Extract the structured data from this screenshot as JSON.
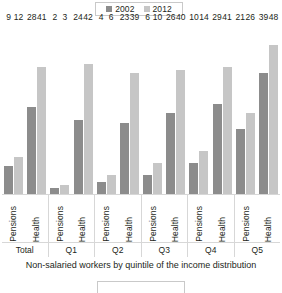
{
  "legend": {
    "position": "top-center",
    "entries": [
      {
        "label": "2002",
        "color": "#8c8c8c"
      },
      {
        "label": "2012",
        "color": "#c6c6c6"
      }
    ]
  },
  "caption": "Non-salaried workers by quintile of the income distribution",
  "chart_data": {
    "type": "bar",
    "title": "",
    "subtitle": "",
    "xlabel": "Non-salaried workers by quintile of the income distribution",
    "ylabel": "",
    "ylim": [
      0,
      52
    ],
    "grid": false,
    "legend_position": "top-center",
    "groups": [
      "Total",
      "Q1",
      "Q2",
      "Q3",
      "Q4",
      "Q5"
    ],
    "subcategories": [
      "Pensions",
      "Health"
    ],
    "categories": [
      "Total - Pensions",
      "Total - Health",
      "Q1 - Pensions",
      "Q1 - Health",
      "Q2 - Pensions",
      "Q2 - Health",
      "Q3 - Pensions",
      "Q3 - Health",
      "Q4 - Pensions",
      "Q4 - Health",
      "Q5 - Pensions",
      "Q5 - Health"
    ],
    "series": [
      {
        "name": "2002",
        "color": "#8c8c8c",
        "values": [
          9,
          28,
          2,
          24,
          4,
          23,
          6,
          26,
          10,
          29,
          21,
          39
        ]
      },
      {
        "name": "2012",
        "color": "#c6c6c6",
        "values": [
          12,
          41,
          3,
          42,
          6,
          39,
          10,
          40,
          14,
          41,
          26,
          48
        ]
      }
    ],
    "grouped": [
      {
        "group": "Total",
        "pairs": [
          {
            "label": "Pensions",
            "v2002": 9,
            "v2012": 12
          },
          {
            "label": "Health",
            "v2002": 28,
            "v2012": 41
          }
        ]
      },
      {
        "group": "Q1",
        "pairs": [
          {
            "label": "Pensions",
            "v2002": 2,
            "v2012": 3
          },
          {
            "label": "Health",
            "v2002": 24,
            "v2012": 42
          }
        ]
      },
      {
        "group": "Q2",
        "pairs": [
          {
            "label": "Pensions",
            "v2002": 4,
            "v2012": 6
          },
          {
            "label": "Health",
            "v2002": 23,
            "v2012": 39
          }
        ]
      },
      {
        "group": "Q3",
        "pairs": [
          {
            "label": "Pensions",
            "v2002": 6,
            "v2012": 10
          },
          {
            "label": "Health",
            "v2002": 26,
            "v2012": 40
          }
        ]
      },
      {
        "group": "Q4",
        "pairs": [
          {
            "label": "Pensions",
            "v2002": 10,
            "v2012": 14
          },
          {
            "label": "Health",
            "v2002": 29,
            "v2012": 41
          }
        ]
      },
      {
        "group": "Q5",
        "pairs": [
          {
            "label": "Pensions",
            "v2002": 21,
            "v2012": 26
          },
          {
            "label": "Health",
            "v2002": 39,
            "v2012": 48
          }
        ]
      }
    ]
  }
}
